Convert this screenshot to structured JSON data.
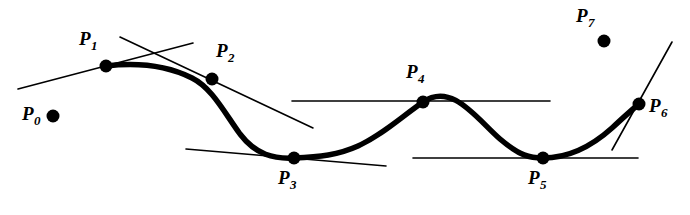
{
  "figure": {
    "type": "diagram",
    "width": 690,
    "height": 215,
    "background_color": "#ffffff",
    "stroke_color": "#000000",
    "curve_stroke_width": 5.5,
    "tangent_stroke_width": 1.6,
    "point_radius": 6.5
  },
  "points": [
    {
      "id": "P0",
      "letter": "P",
      "subscript": "0",
      "x": 53,
      "y": 116,
      "on_curve": false,
      "label_x": 22,
      "label_y": 104,
      "has_tangent": false
    },
    {
      "id": "P1",
      "letter": "P",
      "subscript": "1",
      "x": 106,
      "y": 66,
      "on_curve": true,
      "label_x": 79,
      "label_y": 29,
      "has_tangent": true
    },
    {
      "id": "P2",
      "letter": "P",
      "subscript": "2",
      "x": 212,
      "y": 79,
      "on_curve": true,
      "label_x": 216,
      "label_y": 41,
      "has_tangent": true
    },
    {
      "id": "P3",
      "letter": "P",
      "subscript": "3",
      "x": 294,
      "y": 158,
      "on_curve": true,
      "label_x": 278,
      "label_y": 168,
      "has_tangent": true
    },
    {
      "id": "P4",
      "letter": "P",
      "subscript": "4",
      "x": 423,
      "y": 102,
      "on_curve": true,
      "label_x": 406,
      "label_y": 62,
      "has_tangent": true
    },
    {
      "id": "P5",
      "letter": "P",
      "subscript": "5",
      "x": 543,
      "y": 158,
      "on_curve": true,
      "label_x": 528,
      "label_y": 168,
      "has_tangent": true
    },
    {
      "id": "P6",
      "letter": "P",
      "subscript": "6",
      "x": 639,
      "y": 104,
      "on_curve": true,
      "label_x": 649,
      "label_y": 96,
      "has_tangent": true
    },
    {
      "id": "P7",
      "letter": "P",
      "subscript": "7",
      "x": 604,
      "y": 41,
      "on_curve": false,
      "label_x": 576,
      "label_y": 6,
      "has_tangent": false
    }
  ],
  "curve": {
    "name": "spline-curve",
    "path": "M 106 66 C 140 62 168 66 192 78 C 212 88 224 112 240 134 C 256 155 274 159 294 158 C 320 157 338 155 358 146 C 382 135 400 118 423 102 C 452 82 476 118 500 139 C 520 156 530 158 543 158 C 570 158 592 146 612 128 C 626 115 634 108 639 104"
  },
  "tangents": [
    {
      "name": "tangent-at-p1",
      "x1": 18,
      "y1": 89,
      "x2": 193,
      "y2": 43
    },
    {
      "name": "tangent-at-p2",
      "x1": 120,
      "y1": 37,
      "x2": 313,
      "y2": 128
    },
    {
      "name": "tangent-at-p3",
      "x1": 186,
      "y1": 149,
      "x2": 386,
      "y2": 166
    },
    {
      "name": "tangent-at-p4",
      "x1": 292,
      "y1": 101,
      "x2": 550,
      "y2": 101
    },
    {
      "name": "tangent-at-p5",
      "x1": 413,
      "y1": 158,
      "x2": 638,
      "y2": 158
    },
    {
      "name": "tangent-at-p6",
      "x1": 612,
      "y1": 150,
      "x2": 672,
      "y2": 42
    }
  ]
}
